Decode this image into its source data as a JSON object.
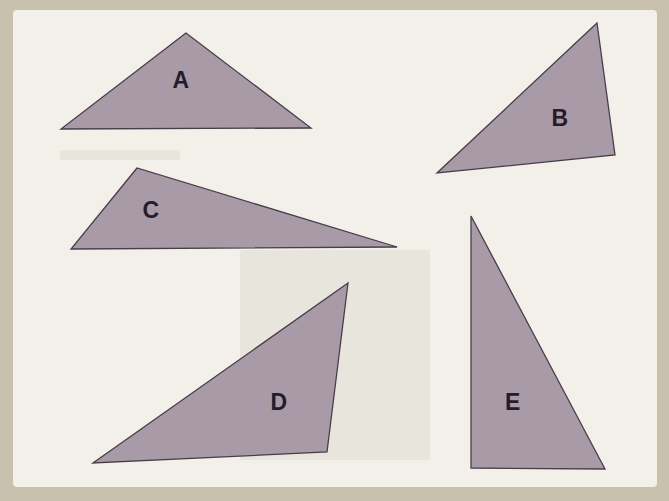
{
  "figure": {
    "colors": {
      "frame": "#c8c1ae",
      "panel": "#f2f0e9",
      "triangle_fill": "#a99aa8",
      "triangle_stroke": "#453f49",
      "label_color": "#241d29"
    },
    "triangles": [
      {
        "id": "A",
        "label": "A",
        "points": [
          [
            186,
            33
          ],
          [
            61,
            129
          ],
          [
            311,
            128
          ]
        ],
        "label_pos": [
          181,
          80
        ]
      },
      {
        "id": "B",
        "label": "B",
        "points": [
          [
            597,
            23
          ],
          [
            437,
            173
          ],
          [
            615,
            155
          ]
        ],
        "label_pos": [
          560,
          118
        ]
      },
      {
        "id": "C",
        "label": "C",
        "points": [
          [
            137,
            168
          ],
          [
            71,
            249
          ],
          [
            397,
            247
          ]
        ],
        "label_pos": [
          151,
          210
        ]
      },
      {
        "id": "D",
        "label": "D",
        "points": [
          [
            348,
            283
          ],
          [
            93,
            463
          ],
          [
            327,
            452
          ]
        ],
        "label_pos": [
          279,
          402
        ]
      },
      {
        "id": "E",
        "label": "E",
        "points": [
          [
            471,
            216
          ],
          [
            471,
            468
          ],
          [
            605,
            469
          ]
        ],
        "label_pos": [
          513,
          402
        ]
      }
    ]
  }
}
